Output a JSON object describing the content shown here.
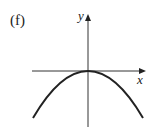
{
  "panel_label": "(f)",
  "axes": {
    "x_label": "x",
    "y_label": "y"
  },
  "colors": {
    "stroke": "#222222",
    "background": "#ffffff"
  },
  "curve": {
    "type": "parabola",
    "opening": "downward",
    "vertex": "origin"
  }
}
